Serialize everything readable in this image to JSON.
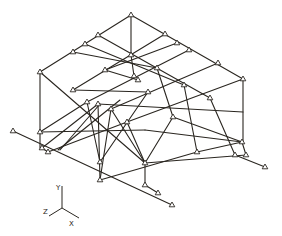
{
  "figure": {
    "type": "isometric-space-frame-structure",
    "line_color": "#2a2620",
    "background": "#ffffff"
  },
  "axes": {
    "origin": [
      62,
      208
    ],
    "labels": [
      {
        "name": "Y",
        "text": "Y",
        "x": 56,
        "y": 187
      },
      {
        "name": "Z",
        "text": "Z",
        "x": 44,
        "y": 214
      },
      {
        "name": "X",
        "text": "X",
        "x": 70,
        "y": 223
      }
    ]
  },
  "nodes": [
    [
      131,
      15
    ],
    [
      98,
      35
    ],
    [
      85,
      44
    ],
    [
      73,
      52
    ],
    [
      40,
      72
    ],
    [
      165,
      34
    ],
    [
      177,
      43
    ],
    [
      189,
      50
    ],
    [
      218,
      63
    ],
    [
      243,
      79
    ],
    [
      131,
      55
    ],
    [
      105,
      70
    ],
    [
      73,
      90
    ],
    [
      157,
      68
    ],
    [
      184,
      85
    ],
    [
      210,
      98
    ],
    [
      134,
      76
    ],
    [
      138,
      80
    ],
    [
      148,
      92
    ],
    [
      87,
      102
    ],
    [
      98,
      104
    ],
    [
      111,
      109
    ],
    [
      127,
      122
    ],
    [
      173,
      117
    ],
    [
      40,
      132
    ],
    [
      42,
      148
    ],
    [
      48,
      152
    ],
    [
      13,
      131
    ],
    [
      100,
      162
    ],
    [
      100,
      180
    ],
    [
      145,
      163
    ],
    [
      145,
      185
    ],
    [
      158,
      193
    ],
    [
      172,
      205
    ],
    [
      197,
      152
    ],
    [
      242,
      142
    ],
    [
      235,
      155
    ],
    [
      246,
      155
    ],
    [
      265,
      167
    ]
  ],
  "members": [
    [
      131,
      15,
      40,
      72
    ],
    [
      131,
      15,
      243,
      79
    ],
    [
      98,
      35,
      210,
      98
    ],
    [
      85,
      44,
      184,
      85
    ],
    [
      73,
      52,
      157,
      68
    ],
    [
      165,
      34,
      73,
      90
    ],
    [
      177,
      43,
      105,
      70
    ],
    [
      189,
      50,
      87,
      102
    ],
    [
      218,
      63,
      111,
      109
    ],
    [
      40,
      72,
      40,
      148
    ],
    [
      131,
      15,
      131,
      55
    ],
    [
      243,
      79,
      243,
      142
    ],
    [
      40,
      72,
      145,
      163
    ],
    [
      73,
      90,
      148,
      92
    ],
    [
      105,
      70,
      138,
      80
    ],
    [
      131,
      55,
      134,
      76
    ],
    [
      157,
      68,
      173,
      117
    ],
    [
      184,
      85,
      197,
      152
    ],
    [
      210,
      98,
      235,
      155
    ],
    [
      243,
      79,
      127,
      122
    ],
    [
      13,
      131,
      172,
      205
    ],
    [
      42,
      148,
      48,
      152
    ],
    [
      87,
      102,
      100,
      162
    ],
    [
      98,
      104,
      100,
      180
    ],
    [
      111,
      109,
      145,
      163
    ],
    [
      87,
      102,
      40,
      132
    ],
    [
      98,
      104,
      42,
      148
    ],
    [
      127,
      122,
      48,
      152
    ],
    [
      98,
      104,
      243,
      112
    ],
    [
      40,
      132,
      145,
      130
    ],
    [
      145,
      130,
      242,
      142
    ],
    [
      145,
      163,
      145,
      185
    ],
    [
      145,
      185,
      158,
      193
    ],
    [
      127,
      122,
      145,
      163
    ],
    [
      173,
      117,
      145,
      163
    ],
    [
      173,
      117,
      242,
      142
    ],
    [
      197,
      152,
      100,
      180
    ],
    [
      197,
      152,
      242,
      142
    ],
    [
      145,
      163,
      246,
      155
    ],
    [
      235,
      155,
      265,
      167
    ],
    [
      242,
      142,
      246,
      155
    ],
    [
      111,
      109,
      100,
      180
    ],
    [
      148,
      92,
      100,
      162
    ],
    [
      60,
      150,
      100,
      104
    ],
    [
      58,
      150,
      120,
      100
    ]
  ]
}
